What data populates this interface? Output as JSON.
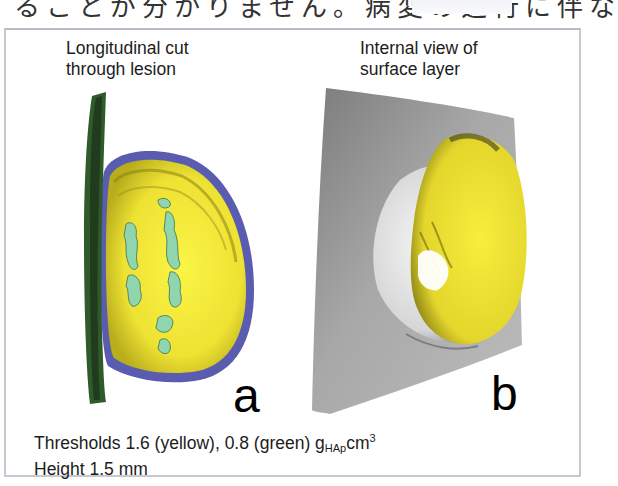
{
  "page": {
    "header_text_partial": "ることが分かりません。病変の進行に伴な"
  },
  "figure": {
    "panels": [
      {
        "id": "a",
        "caption_line1": "Longitudinal cut",
        "caption_line2": "through lesion",
        "letter": "a",
        "image_description": "3D rendering of lesion cut longitudinally: yellow mineral (1.6 g/cm3) interior with green spots (0.8 g/cm3), blue/purple outer boundary, dark green surface strip on left"
      },
      {
        "id": "b",
        "caption_line1": "Internal view of",
        "caption_line2": "surface layer",
        "letter": "b",
        "image_description": "3D rendering of gray surface layer viewed from inside with yellow lesion volume protruding"
      }
    ],
    "footnote": {
      "line1_prefix": "Thresholds 1.6 (yellow), 0.8 (green) g",
      "line1_sub": "HAp",
      "line1_unit": "cm",
      "line1_sup": "3",
      "line2": "Height 1.5 mm"
    },
    "colors": {
      "yellow": "#f2ec3a",
      "green_spots": "#8fd6ae",
      "boundary_blue": "#5a5cb0",
      "surface_strip": "#2f5a2a",
      "surface_gray": "#9a9a9a",
      "frame_border": "#c6c8d2"
    }
  }
}
